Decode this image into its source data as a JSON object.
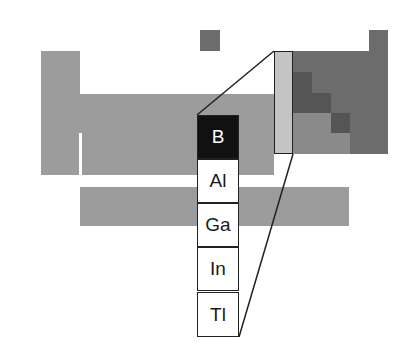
{
  "colors": {
    "background": "#ffffff",
    "main_block": "#9c9c9c",
    "nonmetal_block": "#6c6c6c",
    "metalloid": "#555555",
    "highlighted_column": "#c4c4c4",
    "boron_fill": "#111111",
    "outline": "#222222"
  },
  "group": {
    "label": "Group 13",
    "elements": [
      {
        "symbol": "B",
        "highlighted": true
      },
      {
        "symbol": "Al",
        "highlighted": false
      },
      {
        "symbol": "Ga",
        "highlighted": false
      },
      {
        "symbol": "In",
        "highlighted": false
      },
      {
        "symbol": "Tl",
        "highlighted": false
      }
    ]
  }
}
